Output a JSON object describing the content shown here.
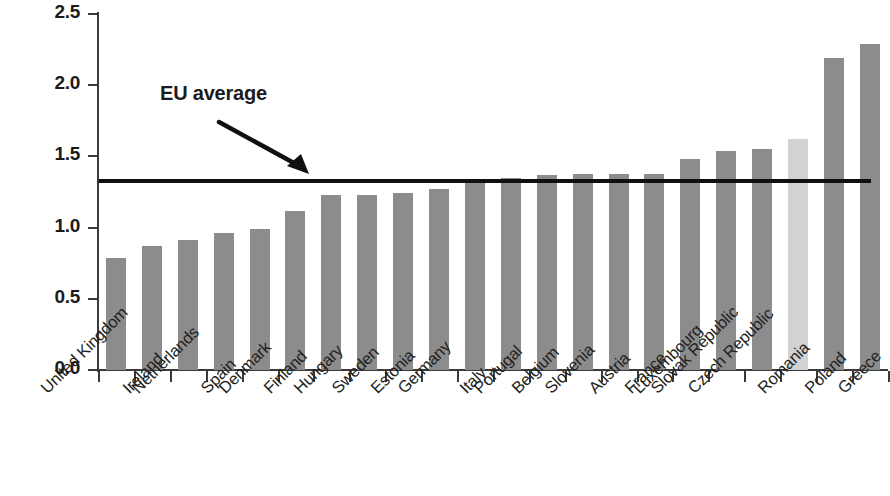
{
  "chart_data": {
    "type": "bar",
    "title": "",
    "subtitle": "",
    "xlabel": "",
    "ylabel": "",
    "ylim": [
      0.0,
      2.5
    ],
    "ytick_labels": [
      "0.0",
      "0.5",
      "1.0",
      "1.5",
      "2.0",
      "2.5"
    ],
    "ytick_values": [
      0.0,
      0.5,
      1.0,
      1.5,
      2.0,
      2.5
    ],
    "grid": false,
    "legend": "none",
    "categories": [
      "United Kingdom",
      "Ireland",
      "Netherlands",
      "Spain",
      "Denmark",
      "Finland",
      "Hungary",
      "Sweden",
      "Estonia",
      "Germany",
      "Italy",
      "Portugal",
      "Belgium",
      "Slovenia",
      "Austria",
      "France",
      "Luxembourg",
      "Slovak Republic",
      "Czech Republic",
      "Romania",
      "Poland",
      "Greece"
    ],
    "values": [
      0.79,
      0.87,
      0.91,
      0.96,
      0.99,
      1.12,
      1.23,
      1.23,
      1.24,
      1.27,
      1.32,
      1.35,
      1.37,
      1.38,
      1.38,
      1.38,
      1.48,
      1.54,
      1.55,
      1.62,
      2.19,
      2.29
    ],
    "highlight_category": "Romania",
    "annotations": [
      {
        "name": "eu-average",
        "label": "EU average",
        "value": 1.33,
        "style": "horizontal-reference-line-with-arrow"
      }
    ],
    "colors": {
      "bar": "#8c8c8c",
      "bar_highlight": "#d2d2d2",
      "axis": "#3a3a3a",
      "reference_line": "#101010",
      "text": "#231f20"
    }
  }
}
